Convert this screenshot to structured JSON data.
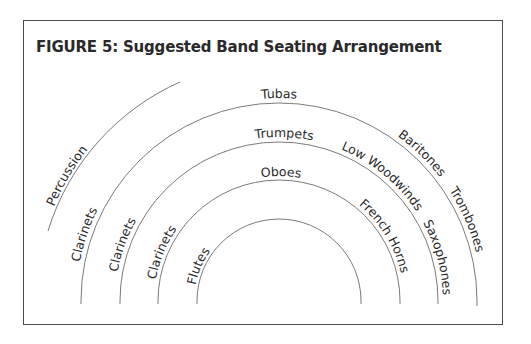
{
  "figure": {
    "title": "FIGURE 5: Suggested Band Seating Arrangement"
  },
  "arcs": {
    "percussion_row": [
      "Percussion"
    ],
    "row_4": [
      "Clarinets",
      "Tubas",
      "Baritones",
      "Trombones"
    ],
    "row_3": [
      "Clarinets",
      "Trumpets",
      "Low Woodwinds",
      "Saxophones"
    ],
    "row_2": [
      "Clarinets",
      "Oboes",
      "French Horns"
    ],
    "row_1": [
      "Flutes"
    ]
  },
  "labels": {
    "percussion": "Percussion",
    "clarinets_outer": "Clarinets",
    "clarinets_middle": "Clarinets",
    "clarinets_inner": "Clarinets",
    "flutes": "Flutes",
    "tubas": "Tubas",
    "trumpets": "Trumpets",
    "oboes": "Oboes",
    "baritones": "Baritones",
    "trombones": "Trombones",
    "low_woodwinds": "Low Woodwinds",
    "saxophones": "Saxophones",
    "french_horns": "French Horns"
  },
  "colors": {
    "frame": "#4a4a4a",
    "arc": "#7a7a7a",
    "text": "#2a2a2a"
  }
}
